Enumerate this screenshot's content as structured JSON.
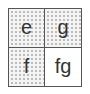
{
  "diagram": {
    "type": "2x2 grid",
    "cells": [
      {
        "label": "e",
        "shaded": true,
        "row": 1,
        "col": 1
      },
      {
        "label": "g",
        "shaded": true,
        "row": 1,
        "col": 2
      },
      {
        "label": "f",
        "shaded": true,
        "row": 2,
        "col": 1
      },
      {
        "label": "fg",
        "shaded": false,
        "row": 2,
        "col": 2
      }
    ],
    "colors": {
      "border": "#555555",
      "shaded_fill": "#f4f4f4",
      "dot": "#b8b8b8",
      "plain_fill": "#ffffff",
      "text": "#333333"
    }
  }
}
